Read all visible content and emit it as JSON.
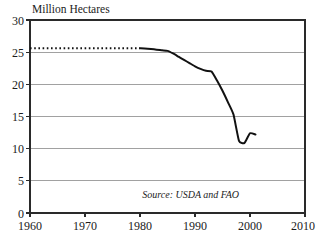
{
  "chart_data": {
    "type": "line",
    "title": "Million Hectares",
    "xlabel": "",
    "ylabel": "Million Hectares",
    "xlim": [
      1960,
      2010
    ],
    "ylim": [
      0,
      30
    ],
    "grid": true,
    "legend": false,
    "x_ticks": [
      1960,
      1970,
      1980,
      1990,
      2000,
      2010
    ],
    "y_ticks": [
      0,
      5,
      10,
      15,
      20,
      25,
      30
    ],
    "annotations": [
      {
        "name": "source-note",
        "text": "Source: USDA and FAO",
        "x": 1998,
        "y": 2.4
      }
    ],
    "series": [
      {
        "name": "Estimated (dashed)",
        "style": "dashed",
        "x": [
          1960,
          1980
        ],
        "values": [
          25.6,
          25.6
        ]
      },
      {
        "name": "Observed (solid)",
        "style": "solid",
        "x": [
          1980,
          1982,
          1984,
          1985,
          1986,
          1987,
          1988,
          1989,
          1990,
          1991,
          1992,
          1993,
          1994,
          1995,
          1996,
          1997,
          1998,
          1999,
          2000,
          2001
        ],
        "values": [
          25.6,
          25.5,
          25.3,
          25.2,
          24.8,
          24.3,
          23.8,
          23.3,
          22.8,
          22.4,
          22.1,
          22.0,
          20.6,
          19.0,
          17.2,
          15.3,
          11.2,
          10.9,
          12.4,
          12.2
        ]
      }
    ]
  },
  "labels": {
    "y_30": "30",
    "y_25": "25",
    "y_20": "20",
    "y_15": "15",
    "y_10": "10",
    "y_5": "5",
    "y_0": "0",
    "x_1960": "1960",
    "x_1970": "1970",
    "x_1980": "1980",
    "x_1990": "1990",
    "x_2000": "2000",
    "x_2010": "2010",
    "title": "Million Hectares",
    "source": "Source: USDA and FAO"
  },
  "colors": {
    "line": "#111111",
    "grid": "#8a8a8a",
    "frame": "#2a2a2a",
    "background": "#ffffff",
    "text": "#1b1b1b"
  }
}
